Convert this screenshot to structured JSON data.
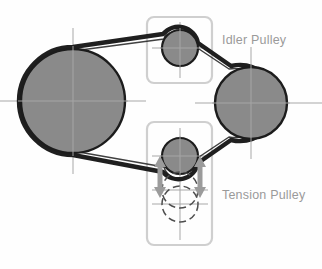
{
  "figure": {
    "type": "mechanical-diagram",
    "background_color": "#fefefe"
  },
  "colors": {
    "pulley_fill": "#8a8a8a",
    "pulley_outline": "#1c1c1c",
    "belt": "#1f1f1f",
    "centerline": "#a8a8a8",
    "callout_box": "#cfcfcf",
    "label_text": "#9a9a9a",
    "arrow": "#9b9b9b",
    "ghost_outline": "#5a5a5a"
  },
  "labels": [
    {
      "id": "idler-pulley-label",
      "text": "Idler Pulley",
      "x": 222,
      "y": 41
    },
    {
      "id": "tension-pulley-label",
      "text": "Tension Pulley",
      "x": 222,
      "y": 196
    }
  ],
  "callout_boxes": [
    {
      "id": "idler-pulley-box",
      "name": "idler-pulley-callout-box",
      "x": 147,
      "y": 17,
      "width": 65,
      "height": 66,
      "rx": 7
    },
    {
      "id": "tension-pulley-box",
      "name": "tension-pulley-callout-box",
      "x": 147,
      "y": 122,
      "width": 65,
      "height": 123,
      "rx": 7
    }
  ],
  "pulleys": [
    {
      "id": "drive-pulley",
      "name": "large-left-pulley",
      "cx": 73,
      "cy": 101,
      "r": 52,
      "style": "solid",
      "crosshair_extent": 73
    },
    {
      "id": "driven-pulley",
      "name": "right-pulley",
      "cx": 251,
      "cy": 103,
      "r": 36,
      "style": "solid",
      "crosshair_extent": 56
    },
    {
      "id": "idler-pulley",
      "name": "idler-pulley",
      "cx": 180,
      "cy": 48,
      "r": 18,
      "style": "solid",
      "crosshair_extent": 32
    },
    {
      "id": "tension-pulley",
      "name": "tension-pulley",
      "cx": 180,
      "cy": 156,
      "r": 18,
      "style": "solid",
      "crosshair_extent": 32
    }
  ],
  "ghost_pulleys": [
    {
      "id": "tension-ghost-1",
      "name": "tension-pulley-ghost-position-1",
      "cx": 180,
      "cy": 190,
      "r": 18,
      "style": "dashed"
    },
    {
      "id": "tension-ghost-2",
      "name": "tension-pulley-ghost-position-2",
      "cx": 180,
      "cy": 204,
      "r": 18,
      "style": "dashed"
    }
  ],
  "travel_arrows": [
    {
      "id": "left-travel-arrow",
      "name": "tension-travel-arrow-left",
      "x": 160,
      "y_top": 158,
      "y_bottom": 196,
      "direction": "double-vertical"
    },
    {
      "id": "right-travel-arrow",
      "name": "tension-travel-arrow-right",
      "x": 200,
      "y_top": 158,
      "y_bottom": 196,
      "direction": "double-vertical"
    }
  ],
  "ghost_centerlines": [
    {
      "cy": 190,
      "x1": 152,
      "x2": 208
    },
    {
      "cy": 204,
      "x1": 152,
      "x2": 208
    }
  ],
  "ghost_vertical_centerline": {
    "cx": 180,
    "y1": 170,
    "y2": 238
  },
  "belt": {
    "name": "drive-belt",
    "outer_width": 4.2,
    "inner_width": 2.0,
    "description": "Continuous belt wrapping large left pulley, running under idler pulley, around right pulley, and back over tension pulley."
  }
}
